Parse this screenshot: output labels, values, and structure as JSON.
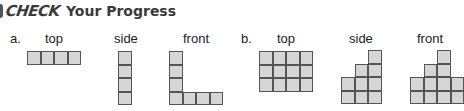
{
  "header": {
    "check_word": "CHECK",
    "title": "Your Progress"
  },
  "problems": [
    {
      "label": "a.",
      "views": [
        {
          "name": "top",
          "label": "top",
          "grid": [
            [
              1,
              1,
              1,
              1
            ]
          ]
        },
        {
          "name": "side",
          "label": "side",
          "grid": [
            [
              1
            ],
            [
              1
            ],
            [
              1
            ],
            [
              1
            ]
          ]
        },
        {
          "name": "front",
          "label": "front",
          "grid": [
            [
              1,
              0,
              0,
              0
            ],
            [
              1,
              0,
              0,
              0
            ],
            [
              1,
              0,
              0,
              0
            ],
            [
              1,
              1,
              1,
              1
            ]
          ]
        }
      ]
    },
    {
      "label": "b.",
      "views": [
        {
          "name": "top",
          "label": "top",
          "grid": [
            [
              1,
              1,
              1,
              1
            ],
            [
              1,
              1,
              1,
              1
            ],
            [
              1,
              1,
              1,
              1
            ]
          ]
        },
        {
          "name": "side",
          "label": "side",
          "grid": [
            [
              0,
              0,
              1
            ],
            [
              0,
              1,
              1
            ],
            [
              1,
              1,
              1
            ],
            [
              1,
              1,
              1
            ]
          ]
        },
        {
          "name": "front",
          "label": "front",
          "grid": [
            [
              0,
              0,
              1,
              0
            ],
            [
              0,
              1,
              1,
              0
            ],
            [
              1,
              1,
              1,
              1
            ],
            [
              1,
              1,
              1,
              1
            ]
          ]
        }
      ]
    }
  ],
  "colors": {
    "cell_fill": "#d6d6d6",
    "cell_border": "#555555"
  }
}
